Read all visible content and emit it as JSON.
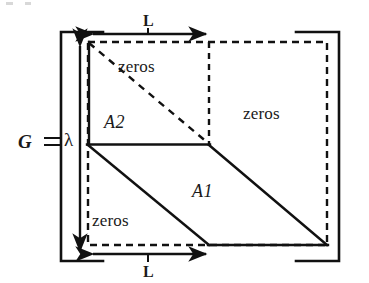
{
  "figure": {
    "kind": "matrix-structure-diagram",
    "colors": {
      "line": "#111111",
      "background": "#ffffff",
      "text": "#1a1a1a"
    },
    "matrix_label": {
      "name": "G",
      "equals": "=",
      "scale": "λ"
    },
    "blocks": [
      {
        "id": "A2",
        "label": "A2"
      },
      {
        "id": "A1",
        "label": "A1"
      }
    ],
    "zero_regions": [
      {
        "id": "zeros-top",
        "label": "zeros"
      },
      {
        "id": "zeros-right",
        "label": "zeros"
      },
      {
        "id": "zeros-bottom-left",
        "label": "zeros"
      }
    ],
    "dimensions": [
      {
        "id": "top-width",
        "label": "L"
      },
      {
        "id": "bottom-width",
        "label": "L"
      }
    ],
    "geometry": {
      "bracket_left_x": 60,
      "bracket_right_x": 340,
      "bracket_top_y": 31,
      "bracket_bottom_y": 262,
      "dashed_rect": {
        "x1": 88,
        "y1": 42,
        "x2": 327,
        "y2": 245
      },
      "split_x": 209,
      "split_y": 144,
      "height_arrow_x": 80
    }
  }
}
